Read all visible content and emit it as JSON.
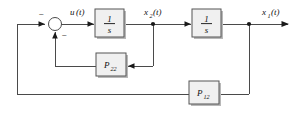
{
  "diagram": {
    "type": "control-block-diagram",
    "signals": {
      "input": "u(t)",
      "input_base": "u",
      "input_arg": "(t)",
      "mid": "x₂(t)",
      "mid_base": "x",
      "mid_sub": "2",
      "mid_arg": "(t)",
      "output": "x₁(t)",
      "output_base": "x",
      "output_sub": "1",
      "output_arg": "(t)"
    },
    "summing_junction": {
      "name": "summing-junction",
      "sign_left": "−",
      "sign_bottom": "−"
    },
    "blocks": [
      {
        "id": "integrator-1",
        "numerator": "1",
        "denominator": "s",
        "label": "1/s"
      },
      {
        "id": "integrator-2",
        "numerator": "1",
        "denominator": "s",
        "label": "1/s"
      },
      {
        "id": "gain-p22",
        "label": "P₂₂",
        "base": "P",
        "subscript": "22"
      },
      {
        "id": "gain-p12",
        "label": "P₁₂",
        "base": "P",
        "subscript": "12"
      }
    ],
    "colors": {
      "block_fill": "#f0f0f0",
      "block_stroke": "#555555",
      "wire": "#4a4a4a",
      "shadow": "#b8b8b8",
      "text": "#101010",
      "background": "#ffffff"
    }
  }
}
